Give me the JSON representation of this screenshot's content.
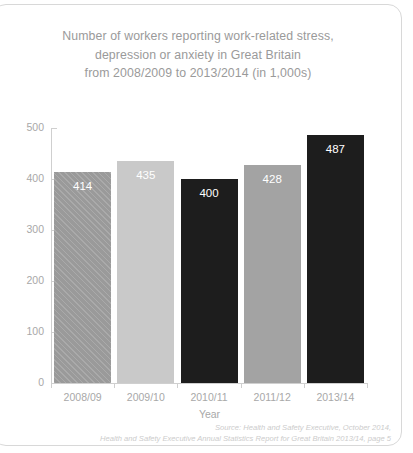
{
  "card": {
    "title_lines": [
      "Number of workers reporting work-related stress,",
      "depression or anxiety in Great Britain",
      "from 2008/2009 to 2013/2014 (in 1,000s)"
    ],
    "source_lines": [
      "Source: Health and Safety Executive, October 2014,",
      "Health and Safety Executive Annual Statistics Report for Great Britain 2013/14, page 5"
    ]
  },
  "chart_data": {
    "type": "bar",
    "title": "Number of workers reporting work-related stress, depression or anxiety in Great Britain from 2008/2009 to 2013/2014 (in 1,000s)",
    "xlabel": "Year",
    "ylabel": "",
    "categories": [
      "2008/09",
      "2009/10",
      "2010/11",
      "2011/12",
      "2013/14"
    ],
    "values": [
      414,
      435,
      400,
      428,
      487
    ],
    "value_labels": [
      "414",
      "435",
      "400",
      "428",
      "487"
    ],
    "bar_styles": [
      "hatch",
      "light",
      "dark",
      "mid",
      "dark"
    ],
    "bar_colors": [
      "#9a9a9a",
      "#c9c9c9",
      "#1d1d1d",
      "#a3a3a3",
      "#1d1d1d"
    ],
    "ylim": [
      0,
      500
    ],
    "yticks": [
      0,
      100,
      200,
      300,
      400,
      500
    ],
    "ytick_labels": [
      "0",
      "100",
      "200",
      "300",
      "400",
      "500"
    ],
    "grid": false,
    "legend": "none",
    "axis_color": "#cfcfcf",
    "tick_label_color": "#a8a8a8",
    "value_label_color": "#ffffff"
  }
}
